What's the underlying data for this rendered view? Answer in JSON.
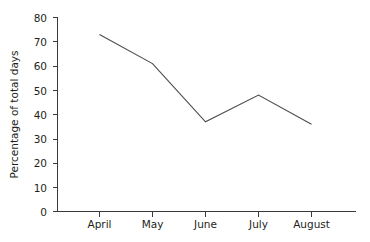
{
  "chart_data": {
    "type": "line",
    "title": "",
    "subtitle": "",
    "xlabel": "",
    "ylabel": "Percentage of total days",
    "categories": [
      "April",
      "May",
      "June",
      "July",
      "August"
    ],
    "values": [
      73,
      61,
      37,
      48,
      36
    ],
    "series": [
      {
        "name": "Percentage of total days",
        "values": [
          73,
          61,
          37,
          48,
          36
        ]
      }
    ],
    "ylim": [
      0,
      80
    ],
    "y_ticks": [
      0,
      10,
      20,
      30,
      40,
      50,
      60,
      70,
      80
    ],
    "y_tick_labels": [
      "0",
      "10",
      "20",
      "30",
      "40",
      "50",
      "60",
      "70",
      "80"
    ],
    "x_tick_labels": [
      "April",
      "May",
      "June",
      "July",
      "August"
    ],
    "grid": false,
    "legend": false,
    "legend_position": "none",
    "line_color": "#4a4a4a",
    "axis_color": "#3a3a3a",
    "background_color": "#ffffff",
    "text_color": "#231f20"
  }
}
